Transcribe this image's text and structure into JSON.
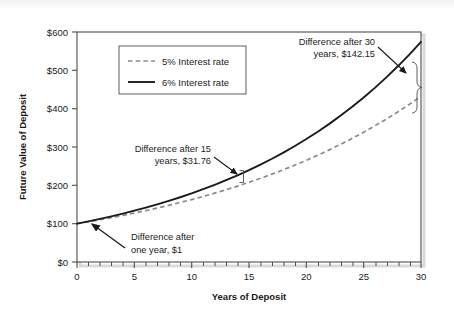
{
  "chart_data": {
    "type": "line",
    "title": "",
    "xlabel": "Years of Deposit",
    "ylabel": "Future Value of Deposit",
    "xlim": [
      0,
      30
    ],
    "ylim": [
      0,
      600
    ],
    "xticks": [
      0,
      5,
      10,
      15,
      20,
      25,
      30
    ],
    "xtick_labels": [
      "0",
      "5",
      "10",
      "15",
      "20",
      "25",
      "30"
    ],
    "xminor_tick_step": 1,
    "yticks": [
      0,
      100,
      200,
      300,
      400,
      500,
      600
    ],
    "ytick_labels": [
      "$0",
      "$100",
      "$200",
      "$300",
      "$400",
      "$500",
      "$600"
    ],
    "grid": false,
    "legend_position": "upper-left-inside",
    "x": [
      0,
      1,
      2,
      3,
      4,
      5,
      6,
      7,
      8,
      9,
      10,
      11,
      12,
      13,
      14,
      15,
      16,
      17,
      18,
      19,
      20,
      21,
      22,
      23,
      24,
      25,
      26,
      27,
      28,
      29,
      30
    ],
    "series": [
      {
        "name": "5% Interest rate",
        "style": "dashed",
        "color": "#8c8c8c",
        "values": [
          100.0,
          105.0,
          110.25,
          115.76,
          121.55,
          127.63,
          134.01,
          140.71,
          147.75,
          155.13,
          162.89,
          171.03,
          179.59,
          188.56,
          197.99,
          207.89,
          218.29,
          229.2,
          240.66,
          252.7,
          265.33,
          278.6,
          292.53,
          307.15,
          322.51,
          338.64,
          355.57,
          373.35,
          392.01,
          411.61,
          432.19
        ]
      },
      {
        "name": "6% Interest rate",
        "style": "solid",
        "color": "#1a1a1a",
        "values": [
          100.0,
          106.0,
          112.36,
          119.1,
          126.25,
          133.82,
          141.85,
          150.36,
          159.38,
          168.95,
          179.08,
          189.83,
          201.22,
          213.29,
          226.09,
          239.66,
          254.04,
          269.28,
          285.43,
          302.56,
          320.71,
          339.96,
          360.35,
          381.97,
          404.89,
          429.19,
          454.94,
          482.23,
          511.17,
          541.84,
          574.35
        ]
      }
    ],
    "annotations": [
      {
        "id": "diff-one-year",
        "line1": "Difference after",
        "line2": "one year, $1",
        "text": "Difference after one year, $1",
        "year": 1,
        "value": 1.0
      },
      {
        "id": "diff-15-years",
        "line1": "Difference after 15",
        "line2": "years, $31.76",
        "text": "Difference after 15 years, $31.76",
        "year": 15,
        "value": 31.76
      },
      {
        "id": "diff-30-years",
        "line1": "Difference after 30",
        "line2": "years, $142.15",
        "text": "Difference after 30 years, $142.15",
        "year": 30,
        "value": 142.15
      }
    ]
  },
  "legend": {
    "items": [
      {
        "label": "5% Interest rate"
      },
      {
        "label": "6% Interest rate"
      }
    ]
  },
  "axes": {
    "x_title": "Years of Deposit",
    "y_title": "Future Value of Deposit"
  },
  "colors": {
    "series_5pct": "#8c8c8c",
    "series_6pct": "#1a1a1a",
    "frame": "#4d4d4d",
    "text": "#1a1a1a",
    "background": "#ffffff"
  }
}
